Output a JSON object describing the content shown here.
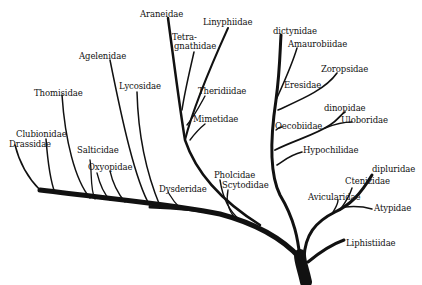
{
  "diagram": {
    "type": "phylogenetic-tree",
    "ink_color": "#111111",
    "background": "#ffffff",
    "labels": [
      {
        "id": "araneidae",
        "text": "Araneidae",
        "x": 140,
        "y": 10
      },
      {
        "id": "linyphiidae",
        "text": "Linyphiidae",
        "x": 203,
        "y": 18
      },
      {
        "id": "tetragnathidae-1",
        "text": "Tetra-",
        "x": 172,
        "y": 33
      },
      {
        "id": "tetragnathidae-2",
        "text": "gnathidae",
        "x": 174,
        "y": 42
      },
      {
        "id": "dictynidae",
        "text": "dictynidae",
        "x": 273,
        "y": 27
      },
      {
        "id": "amaurobiidae",
        "text": "Amaurobiidae",
        "x": 288,
        "y": 40
      },
      {
        "id": "agelenidae",
        "text": "Agelenidae",
        "x": 79,
        "y": 52
      },
      {
        "id": "zoropsidae",
        "text": "Zoropsidae",
        "x": 321,
        "y": 65
      },
      {
        "id": "lycosidae",
        "text": "Lycosidae",
        "x": 119,
        "y": 82
      },
      {
        "id": "eresidae",
        "text": "Eresidae",
        "x": 284,
        "y": 81
      },
      {
        "id": "theridiidae",
        "text": "Theridiidae",
        "x": 198,
        "y": 87
      },
      {
        "id": "thomisidae",
        "text": "Thomisidae",
        "x": 34,
        "y": 89
      },
      {
        "id": "dinopidae",
        "text": "dinopidae",
        "x": 324,
        "y": 104
      },
      {
        "id": "mimetidae",
        "text": "Mimetidae",
        "x": 193,
        "y": 115
      },
      {
        "id": "uloboridae",
        "text": "Uloboridae",
        "x": 341,
        "y": 116
      },
      {
        "id": "oecobiidae",
        "text": "Oecobiidae",
        "x": 275,
        "y": 122
      },
      {
        "id": "clubionidae",
        "text": "Clubionidae",
        "x": 16,
        "y": 130
      },
      {
        "id": "drassidae",
        "text": "Drassidae",
        "x": 9,
        "y": 140
      },
      {
        "id": "hypochilidae",
        "text": "Hypochilidae",
        "x": 303,
        "y": 146
      },
      {
        "id": "salticidae",
        "text": "Salticidae",
        "x": 77,
        "y": 146
      },
      {
        "id": "oxyopidae",
        "text": "Oxyopidae",
        "x": 88,
        "y": 163
      },
      {
        "id": "diplurudae",
        "text": "dipluridae",
        "x": 372,
        "y": 165
      },
      {
        "id": "pholcidae",
        "text": "Pholcidae",
        "x": 214,
        "y": 171
      },
      {
        "id": "ctenizidae",
        "text": "Ctenizidae",
        "x": 345,
        "y": 177
      },
      {
        "id": "dysderidae",
        "text": "Dysderidae",
        "x": 159,
        "y": 185
      },
      {
        "id": "scytodidae",
        "text": "Scytodidae",
        "x": 222,
        "y": 181
      },
      {
        "id": "avicularidae",
        "text": "Avicularidae",
        "x": 308,
        "y": 193
      },
      {
        "id": "atypidae",
        "text": "Atypidae",
        "x": 374,
        "y": 204
      },
      {
        "id": "liphistiidae",
        "text": "Liphistiidae",
        "x": 346,
        "y": 239
      }
    ]
  }
}
